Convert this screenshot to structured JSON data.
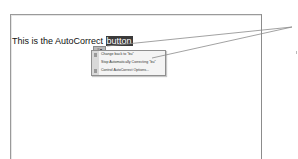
{
  "document": {
    "text_before": "This is the AutoCorrect ",
    "highlighted_word": "button"
  },
  "smart_tag": {
    "glyph": "≡▾",
    "icon": "autocorrect-options-icon"
  },
  "menu": {
    "items": [
      {
        "label": "Change back to \"bu\"",
        "icon": "undo-icon"
      },
      {
        "label": "Stop Automatically Correcting \"bu\"",
        "icon": null
      },
      {
        "label": "Control AutoCorrect Options...",
        "icon": "autocorrect-settings-icon"
      }
    ]
  },
  "colors": {
    "highlight": "#3a3a3a",
    "border": "#9a9a9a",
    "callout_line": "#8a8a8a"
  }
}
